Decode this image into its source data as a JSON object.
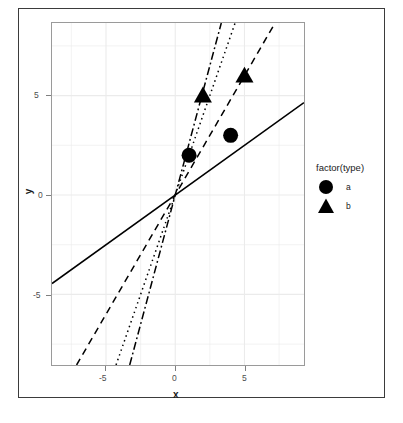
{
  "chart_data": {
    "type": "scatter",
    "title": "",
    "xlabel": "x",
    "ylabel": "y",
    "xlim": [
      -8.9,
      9.3
    ],
    "ylim": [
      -8.55,
      8.65
    ],
    "xticks": [
      -5,
      0,
      5
    ],
    "xticklabels": [
      "-5",
      "0",
      "5"
    ],
    "yticks": [
      -5,
      0,
      5
    ],
    "yticklabels": [
      "-5",
      "0",
      "5"
    ],
    "grid": true,
    "legend": {
      "title": "factor(type)",
      "position": "right",
      "entries": [
        {
          "label": "a",
          "marker": "circle"
        },
        {
          "label": "b",
          "marker": "triangle"
        }
      ]
    },
    "series": [
      {
        "name": "a",
        "marker": "circle",
        "color": "#000000",
        "points": [
          {
            "x": 1,
            "y": 2
          },
          {
            "x": 4,
            "y": 3
          }
        ]
      },
      {
        "name": "b",
        "marker": "triangle",
        "color": "#000000",
        "points": [
          {
            "x": 2,
            "y": 5
          },
          {
            "x": 5,
            "y": 6
          }
        ]
      }
    ],
    "lines": [
      {
        "name": "line-solid",
        "slope": 0.5,
        "intercept": 0,
        "style": "solid",
        "color": "#000000"
      },
      {
        "name": "line-dashed",
        "slope": 1.2,
        "intercept": 0,
        "style": "dashed",
        "color": "#000000"
      },
      {
        "name": "line-dotted",
        "slope": 2.0,
        "intercept": 0,
        "style": "dotted",
        "color": "#000000"
      },
      {
        "name": "line-dashdot",
        "slope": 2.6,
        "intercept": 0,
        "style": "dashdot",
        "color": "#000000"
      }
    ]
  },
  "axes": {
    "x_title": "x",
    "y_title": "y",
    "x_tick_labels": [
      "-5",
      "0",
      "5"
    ],
    "y_tick_labels": [
      "5",
      "0",
      "-5"
    ]
  },
  "legend": {
    "title": "factor(type)",
    "item_a": "a",
    "item_b": "b"
  },
  "colors": {
    "marker": "#000000",
    "line": "#000000",
    "grid": "#ebebeb",
    "panel_border": "#9a9a9a",
    "frame": "#3b3b3b",
    "tick_text": "#4d4d4d"
  }
}
